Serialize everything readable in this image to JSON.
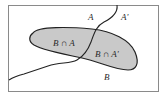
{
  "diagram": {
    "type": "venn-partition",
    "universe_border_color": "#8a8a8a",
    "region_fill": "#c9c9c9",
    "curve_color": "#222222",
    "labels": {
      "A": "A",
      "A_complement": "A'",
      "B": "B",
      "B_and_A": "B ∩ A",
      "B_and_A_complement": "B ∩ A'"
    }
  }
}
